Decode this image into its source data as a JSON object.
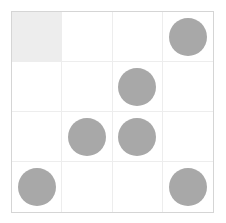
{
  "board": {
    "name": "grid-board",
    "rows": 4,
    "columns": 4,
    "cell_size_px": 51,
    "colors": {
      "piece": "#a8a8a8",
      "highlight_cell": "#ededed",
      "grid_line": "#ededed",
      "outer_border": "#d5d5d5",
      "background": "#ffffff"
    },
    "piece_shape": "circle",
    "piece_diameter_px": 38,
    "cells": [
      [
        {
          "state": "highlight",
          "piece": false,
          "label": ""
        },
        {
          "state": "empty",
          "piece": false,
          "label": ""
        },
        {
          "state": "empty",
          "piece": false,
          "label": ""
        },
        {
          "state": "empty",
          "piece": true,
          "label": ""
        }
      ],
      [
        {
          "state": "empty",
          "piece": false,
          "label": ""
        },
        {
          "state": "empty",
          "piece": false,
          "label": ""
        },
        {
          "state": "empty",
          "piece": true,
          "label": ""
        },
        {
          "state": "empty",
          "piece": false,
          "label": ""
        }
      ],
      [
        {
          "state": "empty",
          "piece": false,
          "label": ""
        },
        {
          "state": "empty",
          "piece": true,
          "label": ""
        },
        {
          "state": "empty",
          "piece": true,
          "label": ""
        },
        {
          "state": "empty",
          "piece": false,
          "label": ""
        }
      ],
      [
        {
          "state": "empty",
          "piece": true,
          "label": ""
        },
        {
          "state": "empty",
          "piece": false,
          "label": ""
        },
        {
          "state": "empty",
          "piece": false,
          "label": ""
        },
        {
          "state": "empty",
          "piece": true,
          "label": ""
        }
      ]
    ]
  }
}
